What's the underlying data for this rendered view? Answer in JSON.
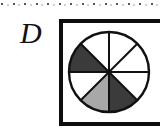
{
  "figure": {
    "panel_letter": "D",
    "background_color": "#ffffff",
    "frame": {
      "border_color": "#0d0d0d",
      "border_width_px": 4,
      "fill_color": "#ffffff"
    },
    "dotted_rule": {
      "dot_color": "#555555",
      "faint_dot_color": "#cfcfcf",
      "dot_count": 14,
      "dot_spacing_px": 11.5
    }
  },
  "chart_data": {
    "type": "pie",
    "title": "D",
    "xlabel": "",
    "ylabel": "",
    "legend": "none",
    "grid": false,
    "outline_color": "#111111",
    "outline_width_px": 2.4,
    "spoke_color": "#111111",
    "spoke_width_px": 2.0,
    "center_x": 109,
    "center_y": 72,
    "radius": 40,
    "slice_count": 8,
    "equal_slices": true,
    "slice_angle_deg": 45,
    "start_angle_deg": 90,
    "categories": [
      "segment-1",
      "segment-2",
      "segment-3",
      "segment-4",
      "segment-5",
      "segment-6",
      "segment-7",
      "segment-8"
    ],
    "values": [
      12.5,
      12.5,
      12.5,
      12.5,
      12.5,
      12.5,
      12.5,
      12.5
    ],
    "slices": [
      {
        "name": "segment-1",
        "start_deg": 90,
        "end_deg": 135,
        "fill": "#ffffff",
        "shade": "white"
      },
      {
        "name": "segment-2",
        "start_deg": 135,
        "end_deg": 180,
        "fill": "#3b3b3b",
        "shade": "dark-gray"
      },
      {
        "name": "segment-3",
        "start_deg": 180,
        "end_deg": 225,
        "fill": "#ffffff",
        "shade": "white"
      },
      {
        "name": "segment-4",
        "start_deg": 225,
        "end_deg": 270,
        "fill": "#a8a8a8",
        "shade": "medium-gray"
      },
      {
        "name": "segment-5",
        "start_deg": 270,
        "end_deg": 315,
        "fill": "#3b3b3b",
        "shade": "dark-gray"
      },
      {
        "name": "segment-6",
        "start_deg": 315,
        "end_deg": 360,
        "fill": "#ffffff",
        "shade": "white"
      },
      {
        "name": "segment-7",
        "start_deg": 0,
        "end_deg": 45,
        "fill": "#ffffff",
        "shade": "white"
      },
      {
        "name": "segment-8",
        "start_deg": 45,
        "end_deg": 90,
        "fill": "#ffffff",
        "shade": "white"
      }
    ],
    "palette": {
      "white": "#ffffff",
      "medium_gray": "#a8a8a8",
      "dark_gray": "#3b3b3b",
      "stroke": "#111111"
    }
  }
}
